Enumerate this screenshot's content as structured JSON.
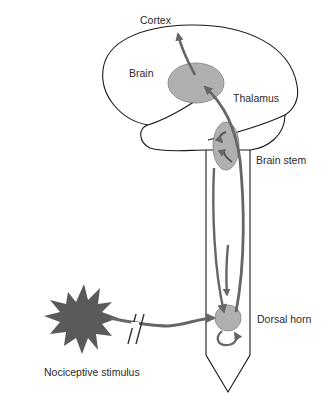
{
  "diagram": {
    "labels": {
      "cortex": "Cortex",
      "brain": "Brain",
      "thalamus": "Thalamus",
      "brain_stem": "Brain stem",
      "dorsal_horn": "Dorsal horn",
      "stimulus": "Nociceptive stimulus"
    },
    "colors": {
      "outline": "#1a1a1a",
      "region_fill": "#b0b0b0",
      "region_stroke": "#7a7a7a",
      "pathway": "#666666",
      "stimulus": "#5a5a5a",
      "text": "#2a2a2a"
    }
  }
}
